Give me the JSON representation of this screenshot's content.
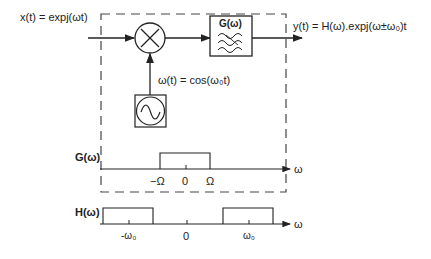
{
  "block_diagram": {
    "input_label": "x(t) = expj(ωt)",
    "input_parts": {
      "x": "x",
      "t": "t",
      "eq": "=expj(ω",
      "t2": "t",
      ")": ")"
    },
    "mixer_symbol": "×",
    "filter_label": "G(ω)",
    "oscillator_label": "ω(t) = cos(ω₀t)",
    "output_label": "y(t) = H(ω).expj(ω±ω₀)t"
  },
  "plot_g": {
    "ylabel": "G(ω)",
    "xlabel": "ω",
    "ticks": [
      "−Ω",
      "0",
      "Ω"
    ]
  },
  "plot_h": {
    "ylabel": "H(ω)",
    "xlabel": "ω",
    "ticks": [
      "-ω₀",
      "0",
      "ω₀"
    ]
  }
}
